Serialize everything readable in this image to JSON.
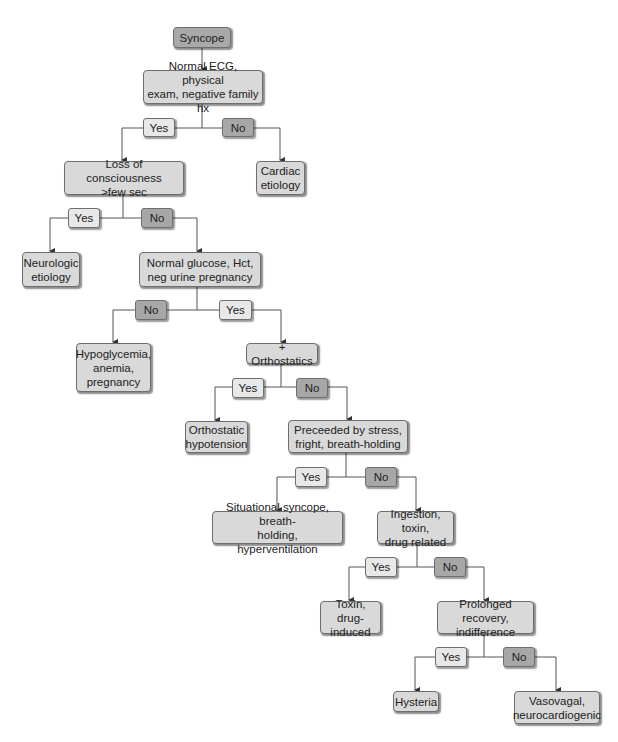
{
  "diagram": {
    "type": "decision-flowchart",
    "colors": {
      "start_fill": "#a9a9a9",
      "node_fill": "#d9d9d9",
      "yes_fill": "#e8e8e8",
      "no_fill": "#a7a7a7",
      "border": "#6e6e6e",
      "line": "#555555"
    },
    "nodes": {
      "syncope": "Syncope",
      "ecg": "Normal ECG, physical\nexam, negative family hx",
      "cardiac": "Cardiac\netiology",
      "loss": "Loss of consciousness\n>few sec",
      "neurologic": "Neurologic\netiology",
      "glucose": "Normal glucose, Hct,\nneg urine pregnancy",
      "hypoglycemia": "Hypoglycemia,\nanemia,\npregnancy",
      "orthostatics": "+ Orthostatics",
      "orthostatic_hypotension": "Orthostatic\nhypotension",
      "preceeded": "Preceeded by stress,\nfright, breath-holding",
      "situational": "Situational syncope, breath-\nholding, hyperventilation",
      "ingestion": "Ingestion, toxin,\ndrug related",
      "toxin": "Toxin, drug-\ninduced",
      "prolonged": "Prolonged recovery,\nindifference",
      "hysteria": "Hysteria",
      "vasovagal": "Vasovagal,\nneurocardiogenic"
    },
    "labels": {
      "yes": "Yes",
      "no": "No"
    },
    "edges": [
      {
        "from": "syncope",
        "to": "ecg",
        "label": ""
      },
      {
        "from": "ecg",
        "to": "loss",
        "label": "Yes"
      },
      {
        "from": "ecg",
        "to": "cardiac",
        "label": "No"
      },
      {
        "from": "loss",
        "to": "neurologic",
        "label": "Yes"
      },
      {
        "from": "loss",
        "to": "glucose",
        "label": "No"
      },
      {
        "from": "glucose",
        "to": "hypoglycemia",
        "label": "No"
      },
      {
        "from": "glucose",
        "to": "orthostatics",
        "label": "Yes"
      },
      {
        "from": "orthostatics",
        "to": "orthostatic_hypotension",
        "label": "Yes"
      },
      {
        "from": "orthostatics",
        "to": "preceeded",
        "label": "No"
      },
      {
        "from": "preceeded",
        "to": "situational",
        "label": "Yes"
      },
      {
        "from": "preceeded",
        "to": "ingestion",
        "label": "No"
      },
      {
        "from": "ingestion",
        "to": "toxin",
        "label": "Yes"
      },
      {
        "from": "ingestion",
        "to": "prolonged",
        "label": "No"
      },
      {
        "from": "prolonged",
        "to": "hysteria",
        "label": "Yes"
      },
      {
        "from": "prolonged",
        "to": "vasovagal",
        "label": "No"
      }
    ]
  }
}
